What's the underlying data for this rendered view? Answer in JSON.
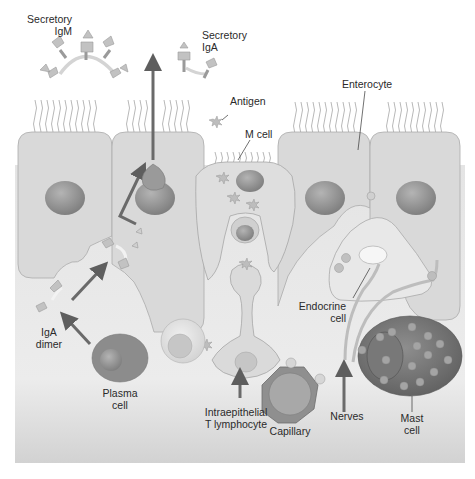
{
  "diagram": {
    "labels": {
      "secretory_igm": "Secretory\nIgM",
      "secretory_iga": "Secretory\nIgA",
      "antigen": "Antigen",
      "m_cell": "M cell",
      "enterocyte": "Enterocyte",
      "endocrine_cell": "Endocrine\ncell",
      "iga_dimer": "IgA\ndimer",
      "plasma_cell": "Plasma\ncell",
      "intraepithelial_t_lymphocyte": "Intraepithelial\nT lymphocyte",
      "capillary": "Capillary",
      "nerves": "Nerves",
      "mast_cell": "Mast\ncell"
    },
    "colors": {
      "background": "#ffffff",
      "lamina_propria": "#e6e6e6",
      "epithelial_cell": "#dadada",
      "cell_outline": "#a8a8a8",
      "nucleus": "#8f8f8f",
      "arrow": "#6e6e6e",
      "mast_cell_body": "#7a7a7a",
      "antibody": "#b0b0b0",
      "label_text": "#2a2a2a"
    }
  }
}
